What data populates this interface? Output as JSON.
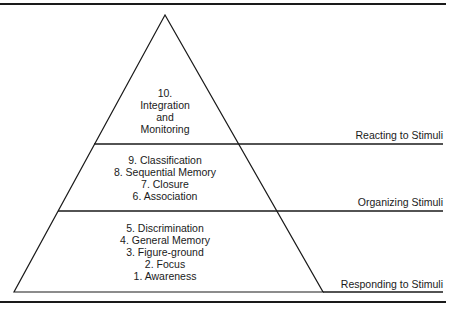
{
  "diagram": {
    "type": "pyramid",
    "tiers": [
      {
        "level": "top",
        "items": [
          "10.",
          "Integration",
          "and",
          "Monitoring"
        ],
        "label": "Reacting to Stimuli"
      },
      {
        "level": "middle",
        "items": [
          "9. Classification",
          "8. Sequential Memory",
          "7. Closure",
          "6. Association"
        ],
        "label": "Organizing Stimuli"
      },
      {
        "level": "bottom",
        "items": [
          "5. Discrimination",
          "4. General Memory",
          "3. Figure-ground",
          "2. Focus",
          "1. Awareness"
        ],
        "label": "Responding to Stimuli"
      }
    ],
    "colors": {
      "stroke": "#1a1a1a",
      "background": "#ffffff"
    }
  }
}
